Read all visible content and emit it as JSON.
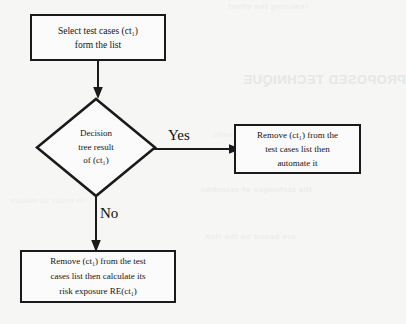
{
  "diagram": {
    "background_color": "#f6f6f5",
    "stroke_color": "#1a1a1a",
    "text_color": "#141414"
  },
  "nodes": {
    "start": {
      "type": "process",
      "name": "select-test-cases",
      "lines": [
        "Select test cases (ct₁)",
        "form the list"
      ]
    },
    "decision": {
      "type": "decision",
      "name": "decision-tree-result",
      "lines": [
        "Decision",
        "tree result",
        "of  (ct₁)"
      ]
    },
    "automate": {
      "type": "process",
      "name": "remove-and-automate",
      "lines": [
        "Remove (ct₁) from the",
        "test cases list then",
        "automate it"
      ]
    },
    "risk": {
      "type": "process",
      "name": "remove-and-calculate-risk",
      "lines": [
        "Remove (ct₁) from the test",
        "cases list then calculate its",
        "risk exposure RE(ct₁)"
      ]
    }
  },
  "edges": {
    "start_to_decision": {
      "label": ""
    },
    "yes_branch": {
      "label": "Yes"
    },
    "no_branch": {
      "label": "No"
    }
  },
  "background_bleed": {
    "note": "faint mirrored scan show-through from reverse side of page",
    "lines": [
      "PROPOSED TECHNIQUE",
      "the technique of selection",
      "are based on the risk",
      "reducing the effort",
      "in order to obtain",
      "automated test suite"
    ]
  }
}
